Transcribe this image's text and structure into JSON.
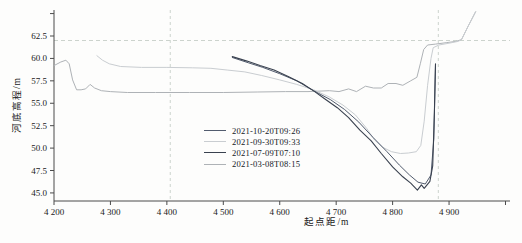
{
  "figure": {
    "background": "#fdfdfc",
    "axis_color": "#4a4a4a",
    "tick_label_color": "#1a1a1a"
  },
  "chart_data": {
    "type": "line",
    "title": "",
    "xlabel": "起点距/m",
    "ylabel": "河底高程/m",
    "xlim": [
      4200,
      5008
    ],
    "ylim": [
      44.1,
      65.4
    ],
    "grid": false,
    "x_ticks": [
      {
        "v": 4200,
        "label": "4 200"
      },
      {
        "v": 4300,
        "label": "4 300"
      },
      {
        "v": 4400,
        "label": "4 400"
      },
      {
        "v": 4500,
        "label": "4 500"
      },
      {
        "v": 4600,
        "label": "4 600"
      },
      {
        "v": 4700,
        "label": "4 700"
      },
      {
        "v": 4800,
        "label": "4 800"
      },
      {
        "v": 4900,
        "label": "4 900"
      },
      {
        "v": 5000,
        "label": ""
      }
    ],
    "y_ticks": [
      {
        "v": 45.0,
        "label": "45.0"
      },
      {
        "v": 47.5,
        "label": "47.5"
      },
      {
        "v": 50.0,
        "label": "50.0"
      },
      {
        "v": 52.5,
        "label": "52.5"
      },
      {
        "v": 55.0,
        "label": "55.0"
      },
      {
        "v": 57.5,
        "label": "57.5"
      },
      {
        "v": 60.0,
        "label": "60.0"
      },
      {
        "v": 62.5,
        "label": "62.5"
      },
      {
        "v": 65.0,
        "label": ""
      }
    ],
    "reference_lines": {
      "style": "dashed",
      "color": "#ccd3cd",
      "horizontal": [
        62.0
      ],
      "vertical": [
        4406,
        4881
      ]
    },
    "legend": {
      "position": "inside lower-middle",
      "items": [
        {
          "label": "2021-10-20T09:26",
          "color": "#525c6e"
        },
        {
          "label": "2021-09-30T09:33",
          "color": "#c9cdd1"
        },
        {
          "label": "2021-07-09T07:10",
          "color": "#39414f"
        },
        {
          "label": "2021-03-08T08:15",
          "color": "#aeb2b6"
        }
      ]
    },
    "series": [
      {
        "name": "2021-03-08T08:15",
        "color": "#aeb2b6",
        "width": 1,
        "points": [
          [
            4200,
            59.2
          ],
          [
            4212,
            59.6
          ],
          [
            4221,
            59.8
          ],
          [
            4227,
            59.4
          ],
          [
            4233,
            57.6
          ],
          [
            4240,
            56.5
          ],
          [
            4248,
            56.5
          ],
          [
            4256,
            56.6
          ],
          [
            4264,
            57.1
          ],
          [
            4272,
            56.7
          ],
          [
            4284,
            56.4
          ],
          [
            4300,
            56.3
          ],
          [
            4330,
            56.2
          ],
          [
            4380,
            56.2
          ],
          [
            4440,
            56.2
          ],
          [
            4500,
            56.2
          ],
          [
            4560,
            56.25
          ],
          [
            4610,
            56.3
          ],
          [
            4650,
            56.3
          ],
          [
            4688,
            56.4
          ],
          [
            4705,
            56.3
          ],
          [
            4722,
            56.6
          ],
          [
            4736,
            56.3
          ],
          [
            4752,
            56.9
          ],
          [
            4766,
            56.7
          ],
          [
            4780,
            56.7
          ],
          [
            4792,
            57.2
          ],
          [
            4806,
            57.2
          ],
          [
            4818,
            57.0
          ],
          [
            4832,
            57.5
          ],
          [
            4843,
            57.9
          ],
          [
            4849,
            59.4
          ],
          [
            4855,
            61.0
          ],
          [
            4862,
            61.5
          ],
          [
            4876,
            61.6
          ],
          [
            4895,
            61.75
          ],
          [
            4912,
            61.9
          ],
          [
            4922,
            62.1
          ],
          [
            4934,
            63.6
          ],
          [
            4947,
            65.2
          ]
        ]
      },
      {
        "name": "2021-09-30T09:33",
        "color": "#c9cdd1",
        "width": 1,
        "points": [
          [
            4276,
            60.3
          ],
          [
            4286,
            59.8
          ],
          [
            4298,
            59.4
          ],
          [
            4318,
            59.1
          ],
          [
            4355,
            59.0
          ],
          [
            4400,
            59.0
          ],
          [
            4445,
            58.95
          ],
          [
            4478,
            58.9
          ],
          [
            4508,
            58.7
          ],
          [
            4538,
            58.5
          ],
          [
            4568,
            58.1
          ],
          [
            4600,
            57.6
          ],
          [
            4630,
            57.1
          ],
          [
            4660,
            56.5
          ],
          [
            4688,
            55.7
          ],
          [
            4712,
            54.8
          ],
          [
            4734,
            53.7
          ],
          [
            4754,
            52.2
          ],
          [
            4768,
            50.9
          ],
          [
            4782,
            50.1
          ],
          [
            4798,
            49.6
          ],
          [
            4814,
            49.4
          ],
          [
            4828,
            49.45
          ],
          [
            4842,
            49.6
          ],
          [
            4850,
            50.3
          ],
          [
            4856,
            53.0
          ],
          [
            4862,
            57.0
          ],
          [
            4868,
            60.0
          ],
          [
            4872,
            61.2
          ],
          [
            4882,
            61.5
          ],
          [
            4900,
            61.7
          ],
          [
            4916,
            61.9
          ],
          [
            4922,
            62.1
          ],
          [
            4934,
            63.6
          ],
          [
            4947,
            65.2
          ]
        ]
      },
      {
        "name": "2021-10-20T09:26",
        "color": "#525c6e",
        "width": 1,
        "points": [
          [
            4516,
            60.1
          ],
          [
            4545,
            59.5
          ],
          [
            4570,
            59.0
          ],
          [
            4600,
            58.3
          ],
          [
            4630,
            57.5
          ],
          [
            4660,
            56.4
          ],
          [
            4690,
            55.4
          ],
          [
            4715,
            54.3
          ],
          [
            4740,
            52.9
          ],
          [
            4765,
            51.2
          ],
          [
            4790,
            49.6
          ],
          [
            4812,
            48.1
          ],
          [
            4830,
            47.0
          ],
          [
            4845,
            46.2
          ],
          [
            4858,
            46.0
          ],
          [
            4868,
            47.0
          ],
          [
            4873,
            51.0
          ],
          [
            4876,
            59.3
          ]
        ]
      },
      {
        "name": "2021-07-09T07:10",
        "color": "#39414f",
        "width": 1.1,
        "points": [
          [
            4516,
            60.2
          ],
          [
            4542,
            59.7
          ],
          [
            4565,
            59.2
          ],
          [
            4590,
            58.7
          ],
          [
            4615,
            58.0
          ],
          [
            4640,
            57.2
          ],
          [
            4662,
            56.3
          ],
          [
            4682,
            55.4
          ],
          [
            4702,
            54.5
          ],
          [
            4722,
            53.4
          ],
          [
            4742,
            52.0
          ],
          [
            4762,
            50.8
          ],
          [
            4780,
            49.4
          ],
          [
            4800,
            47.9
          ],
          [
            4818,
            46.8
          ],
          [
            4832,
            46.1
          ],
          [
            4844,
            45.3
          ],
          [
            4851,
            45.9
          ],
          [
            4856,
            45.5
          ],
          [
            4866,
            46.3
          ],
          [
            4871,
            48.0
          ],
          [
            4874,
            54.0
          ],
          [
            4876,
            59.4
          ]
        ]
      }
    ]
  }
}
